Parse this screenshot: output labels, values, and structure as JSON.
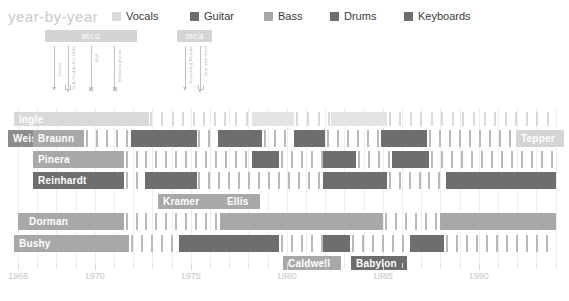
{
  "header": {
    "title": "year-by-year",
    "legend": [
      {
        "label": "Vocals",
        "color": "#d9d9d9",
        "x": 0
      },
      {
        "label": "Guitar",
        "color": "#6e6e6e",
        "x": 78
      },
      {
        "label": "Bass",
        "color": "#a8a8a8",
        "x": 152
      },
      {
        "label": "Drums",
        "color": "#6e6e6e",
        "x": 218
      },
      {
        "label": "Keyboards",
        "color": "#6e6e6e",
        "x": 292
      }
    ]
  },
  "axis": {
    "x_start_px": 18,
    "px_per_year": 19.2,
    "year_min": 1966,
    "year_max": 1994,
    "ticks": [
      1966,
      1970,
      1975,
      1980,
      1985,
      1990
    ],
    "minor_step": 1
  },
  "record_labels": [
    {
      "name": "atco",
      "start": 1967.4,
      "end": 1972.2,
      "color": "#d4d4d4"
    },
    {
      "name": "mca",
      "start": 1974.3,
      "end": 1976.1,
      "color": "#d4d4d4"
    }
  ],
  "albums": [
    {
      "title": "Heavy",
      "year": 1967.9,
      "marker": "arrow",
      "stem": 42,
      "text_h": 30
    },
    {
      "title": "In-A-Gadda-Da-Vida",
      "year": 1968.6,
      "marker": "bracket",
      "stem": 44,
      "text_h": 44
    },
    {
      "title": "Ball",
      "year": 1969.8,
      "marker": "dot",
      "stem": 44,
      "text_h": 16
    },
    {
      "title": "Metamorphosis",
      "year": 1971.0,
      "marker": "dot",
      "stem": 44,
      "text_h": 36
    },
    {
      "title": "Scorching Beauty",
      "year": 1974.7,
      "marker": "arrow",
      "stem": 42,
      "text_h": 38
    },
    {
      "title": "Sun and Steel",
      "year": 1975.5,
      "marker": "bracket",
      "stem": 44,
      "text_h": 30
    }
  ],
  "chart_data": {
    "type": "timeline",
    "title": "year-by-year",
    "xlabel": "",
    "ylabel": "",
    "xlim": [
      1966,
      1994
    ],
    "grid": true,
    "legend_position": "top",
    "colors": {
      "vocals": "#d9d9d9",
      "guitar": "#6e6e6e",
      "bass": "#a8a8a8",
      "drums": "#6e6e6e",
      "keyboards": "#6e6e6e",
      "tick": "#b9b9b9",
      "tick_light": "#d9d9d9",
      "grid": "#eeeeee"
    },
    "rows": [
      {
        "name": "Ingle",
        "role": "vocals",
        "y": 4,
        "h": 14,
        "name_x": 14,
        "name_w": 46,
        "name_color": "#d9d9d9",
        "segments": [
          {
            "start": 1966.0,
            "end": 1972.8,
            "color": "#d9d9d9"
          },
          {
            "start": 1978.2,
            "end": 1980.4,
            "color": "#e4e4e4"
          },
          {
            "start": 1982.3,
            "end": 1985.2,
            "color": "#e4e4e4"
          }
        ],
        "ticks": [
          {
            "start": 1972.9,
            "end": 1978.1,
            "color": "#d9d9d9",
            "step": 0.55
          },
          {
            "start": 1980.5,
            "end": 1982.2,
            "color": "#d9d9d9",
            "step": 0.55
          },
          {
            "start": 1985.3,
            "end": 1994.0,
            "color": "#d9d9d9",
            "step": 0.55
          }
        ]
      },
      {
        "name": "Weis",
        "role": "guitar",
        "y": 22,
        "h": 17,
        "name_x": 8,
        "name_w": 32,
        "name_color": "#8c8c8c",
        "segments": [],
        "ticks": []
      },
      {
        "name": "Braunn",
        "role": "guitar",
        "y": 22,
        "h": 17,
        "name_x": 33,
        "name_w": 51,
        "name_color": "#a8a8a8",
        "segments": [
          {
            "start": 1966.8,
            "end": 1967.9,
            "color": "#a8a8a8"
          },
          {
            "start": 1971.9,
            "end": 1975.3,
            "color": "#6e6e6e"
          },
          {
            "start": 1976.4,
            "end": 1978.7,
            "color": "#6e6e6e"
          },
          {
            "start": 1980.4,
            "end": 1982.0,
            "color": "#6e6e6e"
          },
          {
            "start": 1984.9,
            "end": 1987.3,
            "color": "#6e6e6e"
          }
        ],
        "ticks": [
          {
            "start": 1668.0,
            "end": 1671.8,
            "color": "#b9b9b9",
            "step": 0.52
          },
          {
            "start": 1968.0,
            "end": 1971.8,
            "color": "#b9b9b9",
            "step": 0.52
          },
          {
            "start": 1975.4,
            "end": 1976.3,
            "color": "#b9b9b9",
            "step": 0.52
          },
          {
            "start": 1978.8,
            "end": 1980.3,
            "color": "#b9b9b9",
            "step": 0.52
          },
          {
            "start": 1982.1,
            "end": 1984.8,
            "color": "#b9b9b9",
            "step": 0.52
          },
          {
            "start": 1987.4,
            "end": 1994.0,
            "color": "#b9b9b9",
            "step": 0.52
          }
        ]
      },
      {
        "name": "Tepper",
        "role": "guitar",
        "y": 22,
        "h": 17,
        "name_x": 516,
        "name_w": 48,
        "name_color": "#d4d4d4",
        "segments": [],
        "ticks": []
      },
      {
        "name": "Pinera",
        "role": "guitar",
        "y": 43,
        "h": 17,
        "name_x": 33,
        "name_w": 82,
        "name_color": "#a8a8a8",
        "segments": [
          {
            "start": 1966.8,
            "end": 1971.5,
            "color": "#a8a8a8"
          },
          {
            "start": 1978.2,
            "end": 1979.6,
            "color": "#6e6e6e"
          },
          {
            "start": 1981.9,
            "end": 1983.6,
            "color": "#6e6e6e"
          },
          {
            "start": 1985.5,
            "end": 1987.4,
            "color": "#6e6e6e"
          }
        ],
        "ticks": [
          {
            "start": 1971.6,
            "end": 1978.1,
            "color": "#b9b9b9",
            "step": 0.52
          },
          {
            "start": 1979.7,
            "end": 1981.8,
            "color": "#b9b9b9",
            "step": 0.52
          },
          {
            "start": 1983.7,
            "end": 1985.4,
            "color": "#b9b9b9",
            "step": 0.52
          },
          {
            "start": 1987.5,
            "end": 1994.0,
            "color": "#b9b9b9",
            "step": 0.52
          }
        ]
      },
      {
        "name": "Reinhardt",
        "role": "guitar",
        "y": 64,
        "h": 17,
        "name_x": 33,
        "name_w": 72,
        "name_color": "#6e6e6e",
        "segments": [
          {
            "start": 1966.8,
            "end": 1971.5,
            "color": "#6e6e6e"
          },
          {
            "start": 1972.6,
            "end": 1975.3,
            "color": "#6e6e6e"
          },
          {
            "start": 1981.9,
            "end": 1985.2,
            "color": "#6e6e6e"
          },
          {
            "start": 1988.3,
            "end": 1994.0,
            "color": "#6e6e6e"
          }
        ],
        "ticks": [
          {
            "start": 1971.6,
            "end": 1972.5,
            "color": "#b9b9b9",
            "step": 0.52
          },
          {
            "start": 1975.4,
            "end": 1981.8,
            "color": "#b9b9b9",
            "step": 0.52
          },
          {
            "start": 1985.3,
            "end": 1988.2,
            "color": "#b9b9b9",
            "step": 0.52
          }
        ]
      },
      {
        "name": "Kramer",
        "role": "guitar",
        "y": 86,
        "h": 15,
        "name_x": 158,
        "name_w": 68,
        "name_color": "#a8a8a8",
        "segments": [],
        "ticks": []
      },
      {
        "name": "Ellis",
        "role": "guitar",
        "y": 86,
        "h": 15,
        "name_x": 222,
        "name_w": 38,
        "name_color": "#a8a8a8",
        "segments": [],
        "ticks": []
      },
      {
        "name": "Dorman",
        "role": "bass",
        "y": 105,
        "h": 17,
        "name_x": 24,
        "name_w": 70,
        "name_color": "#a8a8a8",
        "segments": [
          {
            "start": 1966.0,
            "end": 1971.5,
            "color": "#a8a8a8"
          },
          {
            "start": 1976.5,
            "end": 1985.0,
            "color": "#a8a8a8"
          },
          {
            "start": 1988.0,
            "end": 1994.0,
            "color": "#a8a8a8"
          }
        ],
        "ticks": [
          {
            "start": 1971.6,
            "end": 1976.4,
            "color": "#b9b9b9",
            "step": 0.52
          },
          {
            "start": 1985.1,
            "end": 1987.9,
            "color": "#b9b9b9",
            "step": 0.52
          }
        ]
      },
      {
        "name": "Bushy",
        "role": "drums",
        "y": 127,
        "h": 17,
        "name_x": 14,
        "name_w": 62,
        "name_color": "#a8a8a8",
        "segments": [
          {
            "start": 1966.0,
            "end": 1971.8,
            "color": "#a8a8a8"
          },
          {
            "start": 1974.4,
            "end": 1979.6,
            "color": "#6e6e6e"
          },
          {
            "start": 1981.9,
            "end": 1983.3,
            "color": "#6e6e6e"
          },
          {
            "start": 1986.4,
            "end": 1988.2,
            "color": "#6e6e6e"
          }
        ],
        "ticks": [
          {
            "start": 1971.9,
            "end": 1974.3,
            "color": "#b9b9b9",
            "step": 0.52
          },
          {
            "start": 1979.7,
            "end": 1981.8,
            "color": "#b9b9b9",
            "step": 0.52
          },
          {
            "start": 1983.4,
            "end": 1986.3,
            "color": "#b9b9b9",
            "step": 0.52
          },
          {
            "start": 1988.3,
            "end": 1994.0,
            "color": "#b9b9b9",
            "step": 0.52
          }
        ]
      },
      {
        "name": "Caldwell",
        "role": "drums",
        "y": 148,
        "h": 14,
        "name_x": 283,
        "name_w": 58,
        "name_color": "#a8a8a8",
        "segments": [],
        "ticks": []
      },
      {
        "name": "Babylon",
        "role": "drums",
        "y": 148,
        "h": 14,
        "name_x": 351,
        "name_w": 56,
        "name_color": "#6e6e6e",
        "segments": [],
        "ticks": []
      }
    ]
  }
}
